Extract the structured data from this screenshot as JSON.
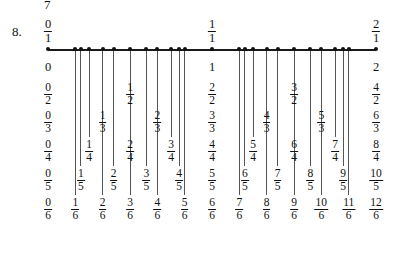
{
  "page": {
    "previous_item_number": "7",
    "item_number": "8."
  },
  "figure": {
    "type": "number-line",
    "axis": {
      "min": 0,
      "max": 2,
      "pixel_left": 48,
      "pixel_right": 376,
      "y": 49
    },
    "row_y": {
      "above": 18,
      "whole": 57,
      "d2": 82,
      "d3": 110,
      "d4": 139,
      "d5": 168,
      "d6": 197,
      "bottom": 226
    },
    "endpoint_columns": [
      {
        "value": 0,
        "x": 48,
        "above": {
          "num": "0",
          "den": "1"
        },
        "whole": "0",
        "stack": [
          {
            "num": "0",
            "den": "2"
          },
          {
            "num": "0",
            "den": "3"
          },
          {
            "num": "0",
            "den": "4"
          },
          {
            "num": "0",
            "den": "5"
          },
          {
            "num": "0",
            "den": "6"
          }
        ]
      },
      {
        "value": 1,
        "x": 212,
        "above": {
          "num": "1",
          "den": "1"
        },
        "whole": "1",
        "stack": [
          {
            "num": "2",
            "den": "2"
          },
          {
            "num": "3",
            "den": "3"
          },
          {
            "num": "4",
            "den": "4"
          },
          {
            "num": "5",
            "den": "5"
          },
          {
            "num": "6",
            "den": "6"
          }
        ]
      },
      {
        "value": 2,
        "x": 376,
        "above": {
          "num": "2",
          "den": "1"
        },
        "whole": "2",
        "stack": [
          {
            "num": "4",
            "den": "2"
          },
          {
            "num": "6",
            "den": "3"
          },
          {
            "num": "8",
            "den": "4"
          },
          {
            "num": "10",
            "den": "5"
          },
          {
            "num": "12",
            "den": "6"
          }
        ]
      }
    ],
    "ticks": [
      {
        "num": "1",
        "den": "6",
        "value": 0.1667,
        "x": 75.3,
        "row": 6
      },
      {
        "num": "1",
        "den": "5",
        "value": 0.2,
        "x": 80.8,
        "row": 5
      },
      {
        "num": "1",
        "den": "4",
        "value": 0.25,
        "x": 89.0,
        "row": 4
      },
      {
        "num": "1",
        "den": "3",
        "value": 0.3333,
        "x": 102.7,
        "row": 3
      },
      {
        "num": "2",
        "den": "5",
        "value": 0.4,
        "x": 113.6,
        "row": 5
      },
      {
        "num": "2",
        "den": "6",
        "value": 0.3333,
        "x": 102.7,
        "row": 6,
        "hidden_tick": true
      },
      {
        "num": "3",
        "den": "6",
        "value": 0.5,
        "x": 130.0,
        "row": 6
      },
      {
        "num": "2",
        "den": "4",
        "value": 0.5,
        "x": 130.0,
        "row": 4,
        "hidden_tick": true
      },
      {
        "num": "1",
        "den": "2",
        "value": 0.5,
        "x": 130.0,
        "row": 2,
        "hidden_tick": true
      },
      {
        "num": "3",
        "den": "5",
        "value": 0.6,
        "x": 146.4,
        "row": 5
      },
      {
        "num": "2",
        "den": "3",
        "value": 0.6667,
        "x": 157.3,
        "row": 3
      },
      {
        "num": "4",
        "den": "6",
        "value": 0.6667,
        "x": 157.3,
        "row": 6,
        "hidden_tick": true
      },
      {
        "num": "3",
        "den": "4",
        "value": 0.75,
        "x": 171.0,
        "row": 4
      },
      {
        "num": "4",
        "den": "5",
        "value": 0.8,
        "x": 179.2,
        "row": 5
      },
      {
        "num": "5",
        "den": "6",
        "value": 0.8333,
        "x": 184.7,
        "row": 6
      },
      {
        "num": "7",
        "den": "6",
        "value": 1.1667,
        "x": 239.3,
        "row": 6
      },
      {
        "num": "6",
        "den": "5",
        "value": 1.2,
        "x": 244.8,
        "row": 5
      },
      {
        "num": "5",
        "den": "4",
        "value": 1.25,
        "x": 253.0,
        "row": 4
      },
      {
        "num": "4",
        "den": "3",
        "value": 1.3333,
        "x": 266.7,
        "row": 3
      },
      {
        "num": "8",
        "den": "6",
        "value": 1.3333,
        "x": 266.7,
        "row": 6,
        "hidden_tick": true
      },
      {
        "num": "7",
        "den": "5",
        "value": 1.4,
        "x": 277.6,
        "row": 5
      },
      {
        "num": "3",
        "den": "2",
        "value": 1.5,
        "x": 294.0,
        "row": 2
      },
      {
        "num": "6",
        "den": "4",
        "value": 1.5,
        "x": 294.0,
        "row": 4,
        "hidden_tick": true
      },
      {
        "num": "9",
        "den": "6",
        "value": 1.5,
        "x": 294.0,
        "row": 6,
        "hidden_tick": true
      },
      {
        "num": "8",
        "den": "5",
        "value": 1.6,
        "x": 310.4,
        "row": 5
      },
      {
        "num": "5",
        "den": "3",
        "value": 1.6667,
        "x": 321.3,
        "row": 3
      },
      {
        "num": "10",
        "den": "6",
        "value": 1.6667,
        "x": 321.3,
        "row": 6,
        "hidden_tick": true
      },
      {
        "num": "7",
        "den": "4",
        "value": 1.75,
        "x": 335.0,
        "row": 4
      },
      {
        "num": "9",
        "den": "5",
        "value": 1.8,
        "x": 343.2,
        "row": 5
      },
      {
        "num": "11",
        "den": "6",
        "value": 1.8333,
        "x": 348.7,
        "row": 6
      }
    ]
  }
}
